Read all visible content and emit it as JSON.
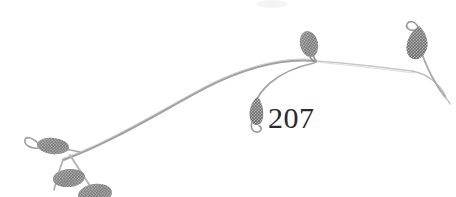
{
  "image": {
    "kind": "botanical-line-illustration",
    "subject": "leafy stem arc with seven leaves",
    "background_color": "#ffffff",
    "width": 456,
    "height": 197
  },
  "caption": {
    "figure_number": "207",
    "color": "#2b2b2b"
  },
  "palette": {
    "leaf_fill": "#767676",
    "leaf_fill_dark": "#5f5f5f",
    "leaf_fill_light": "#8f8f8f",
    "stem_stroke": "#9a9a9a",
    "stem_stroke_light": "#bcbcbc",
    "stem_stroke_faint": "#d2d2d2",
    "smudge": "#f2f2f2"
  },
  "elements": {
    "main_stem_label": "main arcing stem",
    "right_branch_label": "right descending branch",
    "left_branch_label": "lower left branch",
    "leaves": [
      {
        "name": "leaf-left-curled",
        "position": "left, pointing left with curled hook"
      },
      {
        "name": "leaf-lower-left-upper",
        "position": "lower left, above stem"
      },
      {
        "name": "leaf-lower-left-lower",
        "position": "lower left, below stem, cropped at bottom edge"
      },
      {
        "name": "leaf-hanging-center",
        "position": "center, hanging down with curled tail"
      },
      {
        "name": "leaf-top-center",
        "position": "center top, upright oval"
      },
      {
        "name": "leaf-right-curled",
        "position": "far right, upright with curled tip"
      }
    ]
  }
}
